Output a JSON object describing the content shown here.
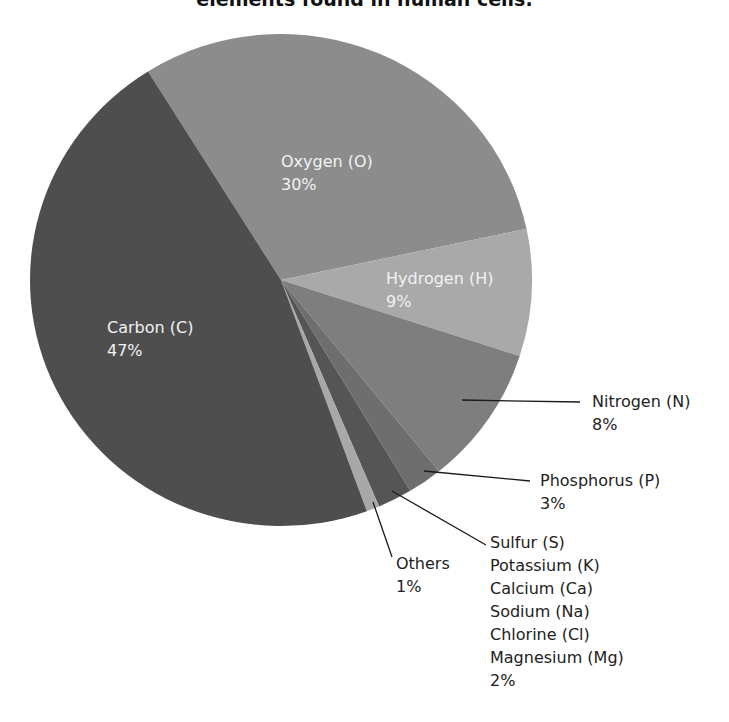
{
  "title": "elements found in human cells.",
  "chart_data": {
    "type": "pie",
    "title": "elements found in human cells.",
    "slices": [
      {
        "name": "Oxygen (O)",
        "value": 30,
        "label": "30%",
        "color": "#8c8c8c",
        "start_deg": 328,
        "end_deg": 438
      },
      {
        "name": "Hydrogen (H)",
        "value": 9,
        "label": "9%",
        "color": "#a9a9a9",
        "start_deg": 78,
        "end_deg": 108
      },
      {
        "name": "Nitrogen (N)",
        "value": 8,
        "label": "8%",
        "color": "#7e7e7e",
        "start_deg": 108,
        "end_deg": 141
      },
      {
        "name": "Phosphorus (P)",
        "value": 3,
        "label": "3%",
        "color": "#6e6e6e",
        "start_deg": 141,
        "end_deg": 149
      },
      {
        "name": "Sulfur (S), Potassium (K), Calcium (Ca), Sodium (Na), Chlorine (Cl), Magnesium (Mg)",
        "value": 2,
        "label": "2%",
        "color": "#555555",
        "start_deg": 149,
        "end_deg": 157
      },
      {
        "name": "Others",
        "value": 1,
        "label": "1%",
        "color": "#a8a8a8",
        "start_deg": 157,
        "end_deg": 160
      },
      {
        "name": "Carbon (C)",
        "value": 47,
        "label": "47%",
        "color": "#4e4e4e",
        "start_deg": 160,
        "end_deg": 328
      }
    ],
    "legend": "none (direct labels)"
  },
  "labels": {
    "oxygen": {
      "name": "Oxygen (O)",
      "pct": "30%"
    },
    "hydrogen": {
      "name": "Hydrogen (H)",
      "pct": "9%"
    },
    "carbon": {
      "name": "Carbon (C)",
      "pct": "47%"
    },
    "nitrogen": {
      "name": "Nitrogen (N)",
      "pct": "8%"
    },
    "phosphorus": {
      "name": "Phosphorus (P)",
      "pct": "3%"
    },
    "others": {
      "name": "Others",
      "pct": "1%"
    },
    "group": {
      "lines": [
        "Sulfur (S)",
        "Potassium (K)",
        "Calcium (Ca)",
        "Sodium (Na)",
        "Chlorine (Cl)",
        "Magnesium (Mg)"
      ],
      "pct": "2%"
    }
  }
}
